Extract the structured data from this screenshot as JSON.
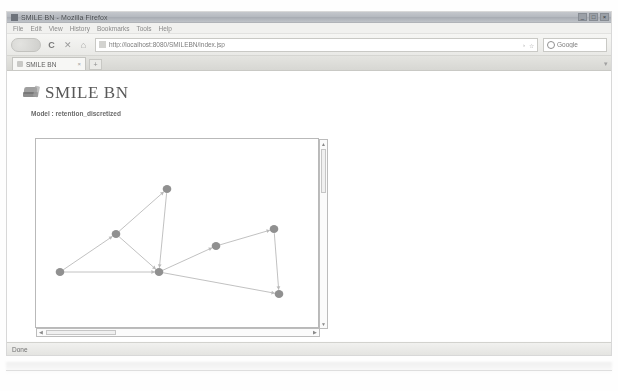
{
  "window": {
    "title": "SMILE BN - Mozilla Firefox",
    "minimize_label": "_",
    "maximize_label": "□",
    "close_label": "×"
  },
  "menubar": {
    "items": [
      {
        "label": "File"
      },
      {
        "label": "Edit"
      },
      {
        "label": "View"
      },
      {
        "label": "History"
      },
      {
        "label": "Bookmarks"
      },
      {
        "label": "Tools"
      },
      {
        "label": "Help"
      }
    ]
  },
  "toolbar": {
    "back_label": "◀",
    "forward_label": "▶",
    "reload_label": "C",
    "stop_label": "✕",
    "home_label": "⌂",
    "url": "http://localhost:8080/SMILEBN/index.jsp",
    "url_placeholder": "Search or enter address",
    "bookmark_star_label": "☆",
    "go_label": "›",
    "search_placeholder": "Google",
    "search_value": ""
  },
  "tabs": {
    "items": [
      {
        "label": "SMILE BN",
        "close_label": "×"
      }
    ],
    "new_tab_label": "+",
    "list_all_label": "▾"
  },
  "app": {
    "logo_name": "smile-bn-logo",
    "title": "SMILE BN",
    "model_line": "Model : retention_discretized"
  },
  "graph": {
    "scroll_up_label": "▲",
    "scroll_down_label": "▼",
    "scroll_left_label": "◀",
    "scroll_right_label": "▶",
    "network": {
      "type": "bayesian-network",
      "nodes": [
        {
          "id": "n1",
          "x": 24,
          "y": 133
        },
        {
          "id": "n2",
          "x": 80,
          "y": 95
        },
        {
          "id": "n3",
          "x": 131,
          "y": 50
        },
        {
          "id": "n4",
          "x": 123,
          "y": 133
        },
        {
          "id": "n5",
          "x": 180,
          "y": 107
        },
        {
          "id": "n6",
          "x": 238,
          "y": 90
        },
        {
          "id": "n7",
          "x": 243,
          "y": 155
        }
      ],
      "edges": [
        {
          "from": "n1",
          "to": "n2"
        },
        {
          "from": "n1",
          "to": "n4"
        },
        {
          "from": "n2",
          "to": "n3"
        },
        {
          "from": "n2",
          "to": "n4"
        },
        {
          "from": "n3",
          "to": "n4"
        },
        {
          "from": "n4",
          "to": "n5"
        },
        {
          "from": "n4",
          "to": "n7"
        },
        {
          "from": "n5",
          "to": "n6"
        },
        {
          "from": "n6",
          "to": "n7"
        }
      ]
    }
  },
  "form": {
    "label": "Enter number of expert(s) :",
    "expert_count_value": "4",
    "expert_count_placeholder": "",
    "ok_label": "OK"
  },
  "status": {
    "text": "Done"
  },
  "colors": {
    "node": "#6d6d6d",
    "edge": "#b4b4b4",
    "panel_border": "#b9b9b9",
    "text": "#6a6a6a"
  }
}
